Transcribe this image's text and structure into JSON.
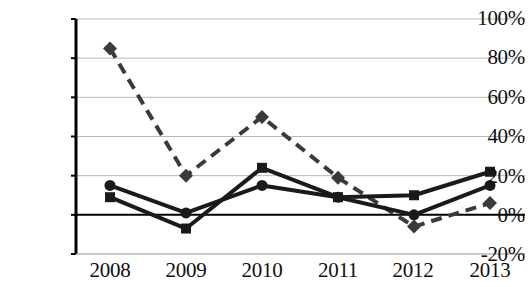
{
  "chart_data": {
    "type": "line",
    "title": "",
    "subtitle": "",
    "xlabel": "",
    "ylabel": "",
    "categories": [
      "2008",
      "2009",
      "2010",
      "2011",
      "2012",
      "2013"
    ],
    "x_tick_labels": [
      "2008",
      "2009",
      "2010",
      "2011",
      "2012",
      "2013"
    ],
    "y_tick_labels": [
      "100%",
      "80%",
      "60%",
      "40%",
      "20%",
      "0%",
      "-20%"
    ],
    "y_tick_values": [
      100,
      80,
      60,
      40,
      20,
      0,
      -20
    ],
    "ylim": [
      -20,
      100
    ],
    "grid": "horizontal",
    "legend": "none",
    "legend_position": "none",
    "zero_line": true,
    "series": [
      {
        "name": "series-diamond-dashed",
        "marker": "diamond",
        "line_style": "dashed",
        "color": "#3a3a3a",
        "values": [
          85,
          20,
          50,
          19,
          -6,
          6
        ]
      },
      {
        "name": "series-circle-solid",
        "marker": "circle",
        "line_style": "solid",
        "color": "#1a1a1a",
        "values": [
          15,
          1,
          15,
          9,
          0,
          15
        ]
      },
      {
        "name": "series-square-solid",
        "marker": "square",
        "line_style": "solid",
        "color": "#1a1a1a",
        "values": [
          9,
          -7,
          24,
          9,
          10,
          22
        ]
      }
    ],
    "annotations": []
  },
  "axes": {
    "y": {
      "ticks": [
        {
          "label": "100%",
          "value": 100,
          "top": 8
        },
        {
          "label": "80%",
          "value": 80,
          "top": 47
        },
        {
          "label": "60%",
          "value": 60,
          "top": 87
        },
        {
          "label": "40%",
          "value": 40,
          "top": 126
        },
        {
          "label": "20%",
          "value": 20,
          "top": 166
        },
        {
          "label": "0%",
          "value": 0,
          "top": 205
        },
        {
          "label": "-20%",
          "value": -20,
          "top": 244
        }
      ]
    },
    "x": {
      "ticks": [
        {
          "label": "2008",
          "left": 65
        },
        {
          "label": "2009",
          "left": 141
        },
        {
          "label": "2010",
          "left": 217
        },
        {
          "label": "2011",
          "left": 293
        },
        {
          "label": "2012",
          "left": 368
        },
        {
          "label": "2013",
          "left": 445
        }
      ]
    }
  },
  "style": {
    "background": "#ffffff",
    "gridline_color": "#b8b8b8",
    "axis_color": "#000000",
    "text_color": "#101010"
  }
}
